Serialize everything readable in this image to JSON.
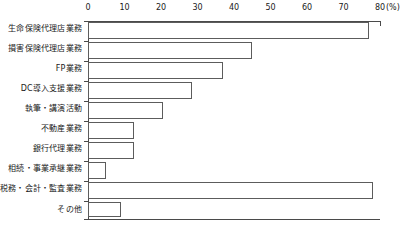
{
  "chart_data": {
    "type": "bar",
    "orientation": "horizontal",
    "title": "",
    "xlabel": "(%)",
    "ylabel": "",
    "xlim": [
      0,
      80
    ],
    "xticks": [
      0,
      10,
      20,
      30,
      40,
      50,
      60,
      70,
      80
    ],
    "xtick_labels": [
      "0",
      "10",
      "20",
      "30",
      "40",
      "50",
      "60",
      "70",
      "80"
    ],
    "unit_label": "(%)",
    "grid": false,
    "legend": null,
    "categories": [
      "生命保険代理店業務",
      "損害保険代理店業務",
      "FP業務",
      "DC導入支援業務",
      "執筆・講演活動",
      "不動産業務",
      "銀行代理業務",
      "相続・事業承継業務",
      "税務・会計・監査業務",
      "その他"
    ],
    "values": [
      77,
      45,
      37,
      28.5,
      20.5,
      12.5,
      12.5,
      5,
      78,
      9
    ]
  }
}
